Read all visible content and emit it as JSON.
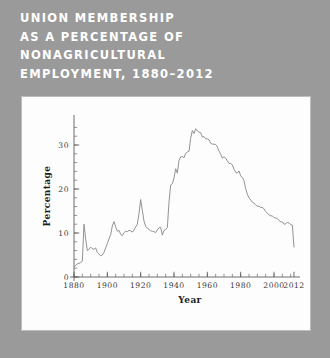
{
  "figure": {
    "title": "UNION MEMBERSHIP\nAS A PERCENTAGE OF\nNONAGRICULTURAL\nEMPLOYMENT, 1880–2012",
    "background_color": "#9a9a9a",
    "panel_color": "#fdfdfd",
    "title_color": "#ffffff",
    "line_color": "#8c8c8c"
  },
  "chart_data": {
    "type": "line",
    "title": "UNION MEMBERSHIP AS A PERCENTAGE OF NONAGRICULTURAL EMPLOYMENT, 1880–2012",
    "xlabel": "Year",
    "ylabel": "Percentage",
    "xlim": [
      1880,
      2012
    ],
    "ylim": [
      0,
      35
    ],
    "grid": false,
    "legend": null,
    "x_ticks": [
      1880,
      1900,
      1920,
      1940,
      1960,
      1980,
      2000,
      2012
    ],
    "x_tick_labels": [
      "1880",
      "1900",
      "1920",
      "1940",
      "1960",
      "1980",
      "2000",
      "2012"
    ],
    "x_minor_step": 5,
    "y_ticks": [
      0,
      10,
      20,
      30
    ],
    "y_tick_labels": [
      "0",
      "10",
      "20",
      "30"
    ],
    "y_minor_step": 2,
    "series": [
      {
        "name": "Union membership (% of nonagricultural employment)",
        "x": [
          1880,
          1881,
          1882,
          1883,
          1884,
          1885,
          1886,
          1887,
          1888,
          1889,
          1890,
          1891,
          1892,
          1893,
          1894,
          1895,
          1896,
          1897,
          1898,
          1899,
          1900,
          1901,
          1902,
          1903,
          1904,
          1905,
          1906,
          1907,
          1908,
          1909,
          1910,
          1911,
          1912,
          1913,
          1914,
          1915,
          1916,
          1917,
          1918,
          1919,
          1920,
          1921,
          1922,
          1923,
          1924,
          1925,
          1926,
          1927,
          1928,
          1929,
          1930,
          1931,
          1932,
          1933,
          1934,
          1935,
          1936,
          1937,
          1938,
          1939,
          1940,
          1941,
          1942,
          1943,
          1944,
          1945,
          1946,
          1947,
          1948,
          1949,
          1950,
          1951,
          1952,
          1953,
          1954,
          1955,
          1956,
          1957,
          1958,
          1959,
          1960,
          1961,
          1962,
          1963,
          1964,
          1965,
          1966,
          1967,
          1968,
          1969,
          1970,
          1971,
          1972,
          1973,
          1974,
          1975,
          1976,
          1977,
          1978,
          1979,
          1980,
          1981,
          1982,
          1983,
          1984,
          1985,
          1986,
          1987,
          1988,
          1989,
          1990,
          1991,
          1992,
          1993,
          1994,
          1995,
          1996,
          1997,
          1998,
          1999,
          2000,
          2001,
          2002,
          2003,
          2004,
          2005,
          2006,
          2007,
          2008,
          2009,
          2010,
          2011,
          2012
        ],
        "y": [
          2.3,
          2.6,
          3.0,
          3.1,
          3.3,
          3.6,
          12.0,
          8.6,
          6.0,
          6.3,
          6.8,
          6.4,
          6.3,
          6.6,
          5.6,
          5.2,
          4.8,
          5.0,
          5.6,
          6.6,
          7.6,
          8.7,
          9.6,
          11.6,
          12.6,
          11.4,
          10.4,
          10.6,
          9.7,
          9.4,
          10.1,
          10.4,
          10.3,
          10.6,
          10.5,
          10.2,
          10.7,
          11.4,
          12.0,
          14.4,
          17.6,
          15.1,
          12.7,
          11.5,
          11.1,
          10.8,
          10.5,
          10.4,
          10.3,
          10.1,
          10.7,
          11.2,
          11.3,
          9.5,
          10.6,
          10.8,
          11.2,
          17.0,
          20.9,
          21.2,
          22.5,
          24.6,
          23.6,
          26.5,
          27.3,
          27.4,
          27.1,
          28.1,
          28.4,
          28.6,
          31.5,
          33.3,
          32.6,
          33.7,
          33.2,
          32.9,
          32.8,
          31.8,
          31.9,
          31.4,
          31.4,
          31.2,
          30.4,
          30.2,
          30.2,
          30.1,
          29.6,
          28.6,
          27.9,
          27.0,
          27.3,
          27.0,
          26.4,
          25.8,
          25.8,
          25.5,
          24.5,
          23.8,
          23.6,
          24.1,
          23.0,
          22.6,
          21.9,
          20.1,
          18.8,
          18.0,
          17.5,
          17.0,
          16.8,
          16.4,
          16.1,
          16.1,
          15.8,
          15.8,
          15.5,
          14.9,
          14.5,
          14.1,
          13.9,
          13.9,
          13.5,
          13.4,
          13.3,
          12.9,
          12.5,
          12.5,
          12.0,
          12.1,
          12.4,
          12.3,
          11.9,
          11.8,
          6.8
        ]
      }
    ]
  }
}
